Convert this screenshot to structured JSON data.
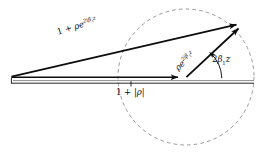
{
  "figure": {
    "name": "phasor-vector-diagram",
    "type": "vector-diagram",
    "background_color": "#ffffff",
    "stroke_color": "#0d0d0d",
    "dashed_color": "#8a8a8a",
    "width": 265,
    "height": 161
  },
  "labels": {
    "resultant": {
      "base": "1 + ",
      "rho": "ρ",
      "e": "e",
      "exponent": "2iβ",
      "exponent_sub": "1",
      "exponent_tail": "z",
      "plain": "1 + ρe^{2iβ₁z}"
    },
    "reflected": {
      "rho": "ρ",
      "e": "e",
      "exponent": "2iβ",
      "exponent_sub": "1",
      "exponent_tail": "z",
      "plain": "ρe^{2iβ₁z}"
    },
    "angle": {
      "value": "2",
      "beta": "β",
      "sub": "1",
      "tail": "z",
      "plain": "2β₁z"
    },
    "baseline": {
      "prefix": "1 + |",
      "rho": "ρ",
      "suffix": "|",
      "plain": "1 + |ρ|"
    }
  },
  "geometry": {
    "apex": {
      "x": 11,
      "y": 77
    },
    "circle_center": {
      "x": 186,
      "y": 77
    },
    "circle_radius": 68,
    "resultant_tip": {
      "x": 243,
      "y": 24
    },
    "baseline_y": 83,
    "baseline_left": 11,
    "baseline_right": 254,
    "angle_arc_radius": 34,
    "angle_degrees": 43,
    "tick_x": 131,
    "tick_y": 83
  }
}
